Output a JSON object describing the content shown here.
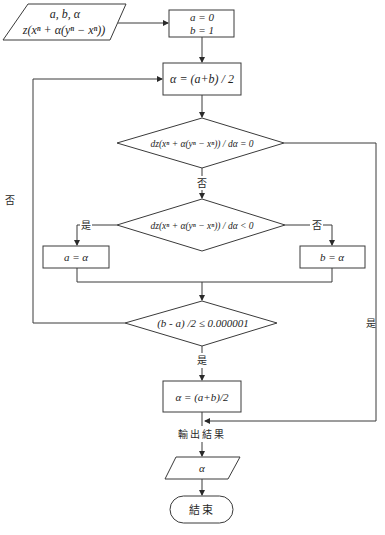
{
  "diagram": {
    "type": "flowchart",
    "nodes": {
      "input": {
        "shape": "parallelogram",
        "line1": "a, b, α",
        "line2": "z(xⁿ + α(yⁿ − xⁿ))"
      },
      "init": {
        "shape": "rect",
        "line1": "a = 0",
        "line2": "b = 1"
      },
      "mid": {
        "shape": "rect",
        "text": "α = (a+b) / 2"
      },
      "cond_zero": {
        "shape": "diamond",
        "text": "dz(xⁿ + α(yⁿ − xⁿ)) / dα = 0"
      },
      "cond_neg": {
        "shape": "diamond",
        "text": "dz(xⁿ + α(yⁿ − xⁿ)) / dα < 0"
      },
      "set_a": {
        "shape": "rect",
        "text": "a = α"
      },
      "set_b": {
        "shape": "rect",
        "text": "b = α"
      },
      "cond_tol": {
        "shape": "diamond",
        "text": "(b - a) /2 ≤ 0.000001"
      },
      "final_mid": {
        "shape": "rect",
        "text": "α = (a+b)/2"
      },
      "output": {
        "shape": "parallelogram",
        "text": "α"
      },
      "end": {
        "shape": "terminal",
        "text": "結束"
      }
    },
    "labels": {
      "yes": "是",
      "no": "否",
      "output_result": "輸出結果"
    },
    "edges": [
      {
        "from": "input",
        "to": "init"
      },
      {
        "from": "init",
        "to": "mid"
      },
      {
        "from": "mid",
        "to": "cond_zero"
      },
      {
        "from": "cond_zero",
        "to": "cond_neg",
        "label": "否"
      },
      {
        "from": "cond_zero",
        "to": "output",
        "label": "是"
      },
      {
        "from": "cond_neg",
        "to": "set_a",
        "label": "是"
      },
      {
        "from": "cond_neg",
        "to": "set_b",
        "label": "否"
      },
      {
        "from": "set_a",
        "to": "cond_tol"
      },
      {
        "from": "set_b",
        "to": "cond_tol"
      },
      {
        "from": "cond_tol",
        "to": "final_mid",
        "label": "是"
      },
      {
        "from": "cond_tol",
        "to": "mid",
        "label": "否"
      },
      {
        "from": "final_mid",
        "to": "output",
        "label": "輸出結果"
      },
      {
        "from": "output",
        "to": "end"
      }
    ],
    "colors": {
      "stroke": "#3a3a3a",
      "text": "#1e1e1e",
      "background": "#ffffff"
    }
  }
}
